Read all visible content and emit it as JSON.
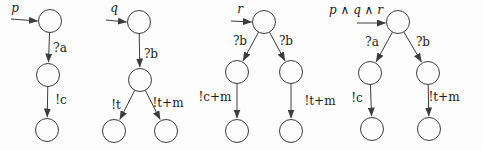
{
  "figure": {
    "width": 483,
    "height": 151
  },
  "style": {
    "background": "#fdfdfd",
    "line_color": "#3c3c3c",
    "node_fill": "#fdfdfd",
    "text_color": "#1b1b1b",
    "node_radius": 11.5
  },
  "diagrams": [
    {
      "id": "p",
      "initial_arrow": {
        "label": "p",
        "label_pos": [
          15,
          8
        ],
        "from": [
          11,
          19
        ],
        "to": [
          37.5,
          21
        ]
      },
      "nodes": [
        {
          "id": "s0",
          "x": 50,
          "y": 21
        },
        {
          "id": "s1",
          "x": 48,
          "y": 75
        },
        {
          "id": "s2",
          "x": 47,
          "y": 130
        }
      ],
      "edges": [
        {
          "from": "s0",
          "to": "s1",
          "label": "?a",
          "label_pos": [
            60,
            48
          ]
        },
        {
          "from": "s1",
          "to": "s2",
          "label": "!c",
          "label_pos": [
            61,
            100
          ]
        }
      ]
    },
    {
      "id": "q",
      "initial_arrow": {
        "label": "q",
        "label_pos": [
          114,
          8
        ],
        "from": [
          106,
          20
        ],
        "to": [
          126.5,
          22
        ]
      },
      "nodes": [
        {
          "id": "s0",
          "x": 139,
          "y": 22
        },
        {
          "id": "s1",
          "x": 140,
          "y": 80
        },
        {
          "id": "s2",
          "x": 114,
          "y": 131
        },
        {
          "id": "s3",
          "x": 166,
          "y": 131
        }
      ],
      "edges": [
        {
          "from": "s0",
          "to": "s1",
          "label": "?b",
          "label_pos": [
            151,
            54
          ]
        },
        {
          "from": "s1",
          "to": "s2",
          "label": "!t",
          "label_pos": [
            116,
            105
          ]
        },
        {
          "from": "s1",
          "to": "s3",
          "label": "!t+m",
          "label_pos": [
            168,
            103
          ]
        }
      ]
    },
    {
      "id": "r",
      "initial_arrow": {
        "label": "r",
        "label_pos": [
          240,
          9
        ],
        "from": [
          231,
          21
        ],
        "to": [
          251.5,
          22
        ]
      },
      "nodes": [
        {
          "id": "s0",
          "x": 264,
          "y": 22
        },
        {
          "id": "s1",
          "x": 237,
          "y": 72
        },
        {
          "id": "s2",
          "x": 291,
          "y": 72
        },
        {
          "id": "s3",
          "x": 237,
          "y": 131
        },
        {
          "id": "s4",
          "x": 291,
          "y": 131
        }
      ],
      "edges": [
        {
          "from": "s0",
          "to": "s1",
          "label": "?b",
          "label_pos": [
            240,
            41
          ]
        },
        {
          "from": "s0",
          "to": "s2",
          "label": "?b",
          "label_pos": [
            286,
            41
          ]
        },
        {
          "from": "s1",
          "to": "s3",
          "label": "!c+m",
          "label_pos": [
            215,
            97
          ]
        },
        {
          "from": "s2",
          "to": "s4",
          "label": "!t+m",
          "label_pos": [
            320,
            101
          ]
        }
      ]
    },
    {
      "id": "p-and-q-and-r",
      "initial_arrow": {
        "label": "p ∧ q ∧ r",
        "label_pos": [
          356,
          10
        ],
        "from": [
          357,
          23
        ],
        "to": [
          385.5,
          23
        ]
      },
      "nodes": [
        {
          "id": "s0",
          "x": 398,
          "y": 22
        },
        {
          "id": "s1",
          "x": 370,
          "y": 73
        },
        {
          "id": "s2",
          "x": 428,
          "y": 73
        },
        {
          "id": "s3",
          "x": 372,
          "y": 129
        },
        {
          "id": "s4",
          "x": 429,
          "y": 129
        }
      ],
      "edges": [
        {
          "from": "s0",
          "to": "s1",
          "label": "?a",
          "label_pos": [
            372,
            42
          ]
        },
        {
          "from": "s0",
          "to": "s2",
          "label": "?b",
          "label_pos": [
            423,
            42
          ]
        },
        {
          "from": "s1",
          "to": "s3",
          "label": "!c",
          "label_pos": [
            357,
            98
          ]
        },
        {
          "from": "s2",
          "to": "s4",
          "label": "!t+m",
          "label_pos": [
            444,
            97
          ]
        }
      ]
    }
  ]
}
